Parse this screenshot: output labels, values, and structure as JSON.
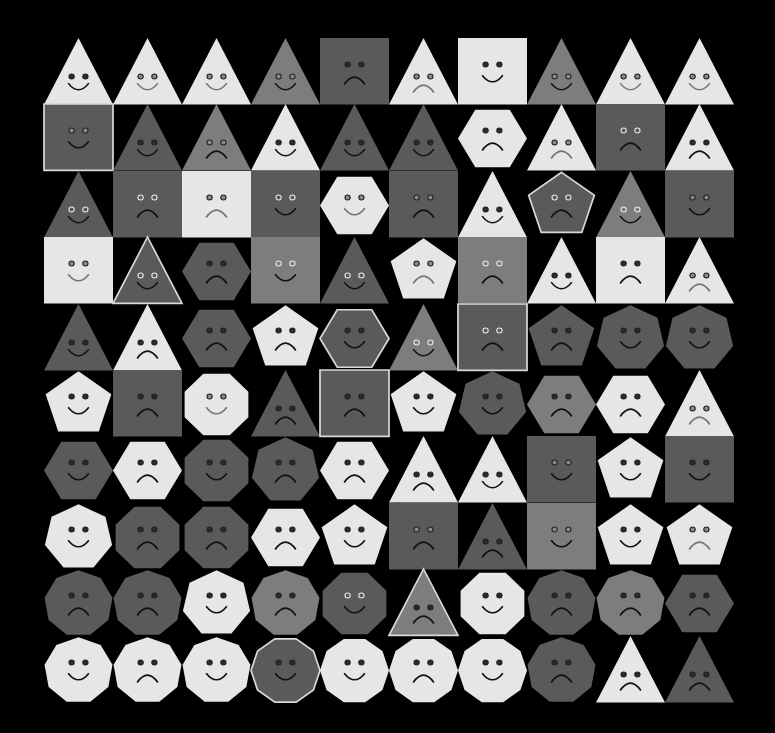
{
  "grid": {
    "rows": 10,
    "cols": 10
  },
  "palette": {
    "white": "#e6e6e6",
    "gray": "#7d7d7d",
    "dark": "#5a5a5a",
    "outline": "#d8d8d8",
    "background": "#000000"
  },
  "cells": [
    [
      {
        "shape": "triangle",
        "fill": "white",
        "mood": "happy",
        "eyes": "dark"
      },
      {
        "shape": "triangle",
        "fill": "white",
        "mood": "happy",
        "eyes": "gray"
      },
      {
        "shape": "triangle",
        "fill": "white",
        "mood": "happy",
        "eyes": "gray"
      },
      {
        "shape": "triangle",
        "fill": "gray",
        "mood": "happy",
        "eyes": "gray"
      },
      {
        "shape": "square",
        "fill": "dark",
        "mood": "sad",
        "eyes": "dark"
      },
      {
        "shape": "triangle",
        "fill": "white",
        "mood": "sad",
        "eyes": "gray"
      },
      {
        "shape": "square",
        "fill": "white",
        "mood": "happy",
        "eyes": "dark"
      },
      {
        "shape": "triangle",
        "fill": "gray",
        "mood": "happy",
        "eyes": "gray"
      },
      {
        "shape": "triangle",
        "fill": "white",
        "mood": "happy",
        "eyes": "gray"
      },
      {
        "shape": "triangle",
        "fill": "white",
        "mood": "happy",
        "eyes": "gray"
      }
    ],
    [
      {
        "shape": "square",
        "fill": "dark",
        "mood": "happy",
        "eyes": "gray",
        "outline": true
      },
      {
        "shape": "triangle",
        "fill": "dark",
        "mood": "happy",
        "eyes": "dark"
      },
      {
        "shape": "triangle",
        "fill": "gray",
        "mood": "sad",
        "eyes": "gray"
      },
      {
        "shape": "triangle",
        "fill": "white",
        "mood": "happy",
        "eyes": "dark"
      },
      {
        "shape": "triangle",
        "fill": "dark",
        "mood": "happy",
        "eyes": "dark"
      },
      {
        "shape": "triangle",
        "fill": "dark",
        "mood": "happy",
        "eyes": "dark"
      },
      {
        "shape": "hexagon",
        "fill": "white",
        "mood": "sad",
        "eyes": "dark"
      },
      {
        "shape": "triangle",
        "fill": "white",
        "mood": "sad",
        "eyes": "gray"
      },
      {
        "shape": "square",
        "fill": "dark",
        "mood": "sad",
        "eyes": "light"
      },
      {
        "shape": "triangle",
        "fill": "white",
        "mood": "sad",
        "eyes": "dark"
      }
    ],
    [
      {
        "shape": "triangle",
        "fill": "dark",
        "mood": "happy",
        "eyes": "light"
      },
      {
        "shape": "square",
        "fill": "dark",
        "mood": "sad",
        "eyes": "light"
      },
      {
        "shape": "square",
        "fill": "white",
        "mood": "sad",
        "eyes": "gray"
      },
      {
        "shape": "square",
        "fill": "dark",
        "mood": "happy",
        "eyes": "light"
      },
      {
        "shape": "hexagon",
        "fill": "white",
        "mood": "happy",
        "eyes": "gray"
      },
      {
        "shape": "square",
        "fill": "dark",
        "mood": "sad",
        "eyes": "gray"
      },
      {
        "shape": "triangle",
        "fill": "white",
        "mood": "happy",
        "eyes": "dark"
      },
      {
        "shape": "pentagon",
        "fill": "dark",
        "mood": "sad",
        "eyes": "light",
        "outline": true
      },
      {
        "shape": "triangle",
        "fill": "gray",
        "mood": "happy",
        "eyes": "light"
      },
      {
        "shape": "square",
        "fill": "dark",
        "mood": "happy",
        "eyes": "gray"
      }
    ],
    [
      {
        "shape": "square",
        "fill": "white",
        "mood": "happy",
        "eyes": "gray"
      },
      {
        "shape": "triangle",
        "fill": "dark",
        "mood": "happy",
        "eyes": "light",
        "outline": true
      },
      {
        "shape": "hexagon",
        "fill": "dark",
        "mood": "sad",
        "eyes": "dark"
      },
      {
        "shape": "square",
        "fill": "gray",
        "mood": "happy",
        "eyes": "light"
      },
      {
        "shape": "triangle",
        "fill": "dark",
        "mood": "happy",
        "eyes": "light"
      },
      {
        "shape": "pentagon",
        "fill": "white",
        "mood": "sad",
        "eyes": "gray"
      },
      {
        "shape": "square",
        "fill": "gray",
        "mood": "sad",
        "eyes": "light"
      },
      {
        "shape": "triangle",
        "fill": "white",
        "mood": "happy",
        "eyes": "dark"
      },
      {
        "shape": "square",
        "fill": "white",
        "mood": "sad",
        "eyes": "dark"
      },
      {
        "shape": "triangle",
        "fill": "white",
        "mood": "sad",
        "eyes": "gray"
      }
    ],
    [
      {
        "shape": "triangle",
        "fill": "dark",
        "mood": "happy",
        "eyes": "dark"
      },
      {
        "shape": "triangle",
        "fill": "white",
        "mood": "sad",
        "eyes": "dark"
      },
      {
        "shape": "hexagon",
        "fill": "dark",
        "mood": "sad",
        "eyes": "dark"
      },
      {
        "shape": "pentagon",
        "fill": "white",
        "mood": "sad",
        "eyes": "dark"
      },
      {
        "shape": "hexagon",
        "fill": "dark",
        "mood": "happy",
        "eyes": "dark",
        "outline": true
      },
      {
        "shape": "triangle",
        "fill": "gray",
        "mood": "happy",
        "eyes": "light"
      },
      {
        "shape": "square",
        "fill": "dark",
        "mood": "sad",
        "eyes": "light",
        "outline": true
      },
      {
        "shape": "pentagon",
        "fill": "dark",
        "mood": "sad",
        "eyes": "dark"
      },
      {
        "shape": "heptagon",
        "fill": "dark",
        "mood": "happy",
        "eyes": "dark"
      },
      {
        "shape": "heptagon",
        "fill": "dark",
        "mood": "happy",
        "eyes": "dark"
      }
    ],
    [
      {
        "shape": "pentagon",
        "fill": "white",
        "mood": "happy",
        "eyes": "dark"
      },
      {
        "shape": "square",
        "fill": "dark",
        "mood": "sad",
        "eyes": "dark"
      },
      {
        "shape": "octagon",
        "fill": "white",
        "mood": "happy",
        "eyes": "gray"
      },
      {
        "shape": "triangle",
        "fill": "dark",
        "mood": "sad",
        "eyes": "dark"
      },
      {
        "shape": "square",
        "fill": "dark",
        "mood": "sad",
        "eyes": "dark",
        "outline": true
      },
      {
        "shape": "pentagon",
        "fill": "white",
        "mood": "happy",
        "eyes": "dark"
      },
      {
        "shape": "heptagon",
        "fill": "dark",
        "mood": "happy",
        "eyes": "dark"
      },
      {
        "shape": "hexagon",
        "fill": "gray",
        "mood": "sad",
        "eyes": "dark"
      },
      {
        "shape": "hexagon",
        "fill": "white",
        "mood": "sad",
        "eyes": "dark"
      },
      {
        "shape": "triangle",
        "fill": "white",
        "mood": "sad",
        "eyes": "gray"
      }
    ],
    [
      {
        "shape": "hexagon",
        "fill": "dark",
        "mood": "happy",
        "eyes": "dark"
      },
      {
        "shape": "hexagon",
        "fill": "white",
        "mood": "sad",
        "eyes": "dark"
      },
      {
        "shape": "octagon",
        "fill": "dark",
        "mood": "happy",
        "eyes": "dark"
      },
      {
        "shape": "heptagon",
        "fill": "dark",
        "mood": "sad",
        "eyes": "dark"
      },
      {
        "shape": "hexagon",
        "fill": "white",
        "mood": "sad",
        "eyes": "dark"
      },
      {
        "shape": "triangle",
        "fill": "white",
        "mood": "sad",
        "eyes": "dark"
      },
      {
        "shape": "triangle",
        "fill": "white",
        "mood": "happy",
        "eyes": "dark"
      },
      {
        "shape": "square",
        "fill": "dark",
        "mood": "happy",
        "eyes": "gray"
      },
      {
        "shape": "pentagon",
        "fill": "white",
        "mood": "happy",
        "eyes": "dark"
      },
      {
        "shape": "square",
        "fill": "dark",
        "mood": "happy",
        "eyes": "dark"
      }
    ],
    [
      {
        "shape": "heptagon",
        "fill": "white",
        "mood": "happy",
        "eyes": "dark"
      },
      {
        "shape": "octagon",
        "fill": "dark",
        "mood": "sad",
        "eyes": "dark"
      },
      {
        "shape": "octagon",
        "fill": "dark",
        "mood": "sad",
        "eyes": "dark"
      },
      {
        "shape": "hexagon",
        "fill": "white",
        "mood": "sad",
        "eyes": "dark"
      },
      {
        "shape": "pentagon",
        "fill": "white",
        "mood": "happy",
        "eyes": "dark"
      },
      {
        "shape": "square",
        "fill": "dark",
        "mood": "sad",
        "eyes": "gray"
      },
      {
        "shape": "triangle",
        "fill": "dark",
        "mood": "sad",
        "eyes": "dark"
      },
      {
        "shape": "square",
        "fill": "gray",
        "mood": "happy",
        "eyes": "gray"
      },
      {
        "shape": "pentagon",
        "fill": "white",
        "mood": "happy",
        "eyes": "dark"
      },
      {
        "shape": "pentagon",
        "fill": "white",
        "mood": "sad",
        "eyes": "gray"
      }
    ],
    [
      {
        "shape": "nonagon",
        "fill": "dark",
        "mood": "sad",
        "eyes": "dark"
      },
      {
        "shape": "nonagon",
        "fill": "dark",
        "mood": "sad",
        "eyes": "dark"
      },
      {
        "shape": "heptagon",
        "fill": "white",
        "mood": "happy",
        "eyes": "dark"
      },
      {
        "shape": "nonagon",
        "fill": "gray",
        "mood": "sad",
        "eyes": "dark"
      },
      {
        "shape": "octagon",
        "fill": "dark",
        "mood": "happy",
        "eyes": "light"
      },
      {
        "shape": "triangle",
        "fill": "gray",
        "mood": "sad",
        "eyes": "dark",
        "outline": true
      },
      {
        "shape": "octagon",
        "fill": "white",
        "mood": "happy",
        "eyes": "dark"
      },
      {
        "shape": "nonagon",
        "fill": "dark",
        "mood": "sad",
        "eyes": "dark"
      },
      {
        "shape": "nonagon",
        "fill": "gray",
        "mood": "sad",
        "eyes": "dark"
      },
      {
        "shape": "hexagon",
        "fill": "dark",
        "mood": "sad",
        "eyes": "dark"
      }
    ],
    [
      {
        "shape": "nonagon",
        "fill": "white",
        "mood": "happy",
        "eyes": "dark"
      },
      {
        "shape": "nonagon",
        "fill": "white",
        "mood": "sad",
        "eyes": "dark"
      },
      {
        "shape": "nonagon",
        "fill": "white",
        "mood": "happy",
        "eyes": "dark"
      },
      {
        "shape": "decagon",
        "fill": "dark",
        "mood": "happy",
        "eyes": "dark",
        "outline": true
      },
      {
        "shape": "decagon",
        "fill": "white",
        "mood": "happy",
        "eyes": "dark"
      },
      {
        "shape": "decagon",
        "fill": "white",
        "mood": "sad",
        "eyes": "dark"
      },
      {
        "shape": "decagon",
        "fill": "white",
        "mood": "happy",
        "eyes": "dark"
      },
      {
        "shape": "nonagon",
        "fill": "dark",
        "mood": "sad",
        "eyes": "dark"
      },
      {
        "shape": "triangle",
        "fill": "white",
        "mood": "sad",
        "eyes": "dark"
      },
      {
        "shape": "triangle",
        "fill": "dark",
        "mood": "sad",
        "eyes": "dark"
      }
    ]
  ]
}
